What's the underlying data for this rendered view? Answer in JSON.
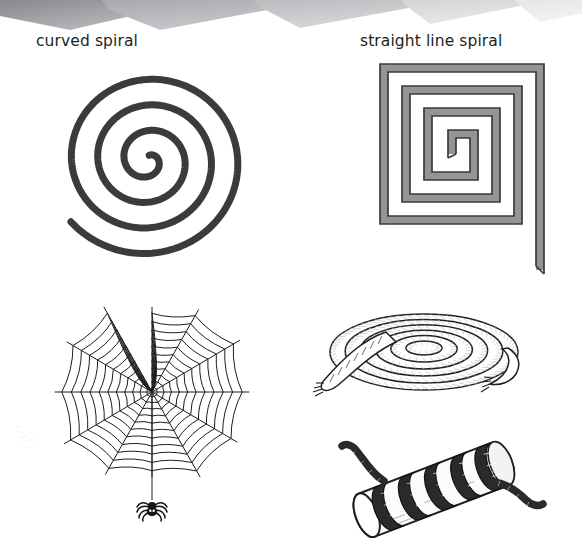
{
  "page": {
    "background_color": "#ffffff",
    "width": 582,
    "height": 549
  },
  "decoration": {
    "top_band": {
      "name": "zigzag-band",
      "description": "row of overlapping gray triangular paper shapes along the top edge",
      "colors": [
        "#8f9093",
        "#a8a9ac",
        "#b9babd",
        "#cbcccf",
        "#dcdddf",
        "#ececed"
      ]
    },
    "smudge": {
      "name": "faint-pencil-smudge",
      "color": "#9a9a9a"
    }
  },
  "labels": {
    "curved_spiral": "curved spiral",
    "straight_line_spiral": "straight line spiral",
    "text_color": "#231f20"
  },
  "figures": [
    {
      "id": "curved-spiral",
      "name": "curved-spiral-drawing",
      "caption": "curved spiral",
      "type": "archimedean-spiral",
      "turns": 3.6,
      "stroke_color": "#3c3b3b",
      "stroke_width": 7,
      "fill": "none",
      "description": "hand drawn round spiral, thick charcoal line, opening at upper right"
    },
    {
      "id": "straight-line-spiral",
      "name": "square-spiral-drawing",
      "caption": "straight line spiral",
      "type": "square-spiral",
      "turns": 4,
      "stroke_color": "#3c3b3b",
      "fill_color": "#949496",
      "stroke_width": 1.6,
      "band_width": 7,
      "description": "rectangular spiral band, gray fill with dark outline, tail continues past the lower right corner"
    },
    {
      "id": "spider-web",
      "name": "spider-web-drawing",
      "type": "orb-web",
      "radials": 12,
      "rings": 11,
      "stroke_color": "#1c1c1c",
      "stroke_width": 1,
      "has_spider": true,
      "spider_color": "#141414",
      "description": "orb spider web with radial spokes and concentric capture spiral, a small spider hangs from a thread below"
    },
    {
      "id": "coiled-rope",
      "name": "coiled-rope-drawing",
      "type": "flat-rope-coil",
      "coils": 6,
      "stroke_color": "#1f1f1f",
      "fill_color": "#ffffff",
      "shade_color": "#b9b9b9",
      "description": "rope coiled flat in an elliptical spiral seen in perspective, twisted fibre texture, frayed ends at left and right"
    },
    {
      "id": "rope-wrapped-log",
      "name": "rope-wrapped-log-drawing",
      "type": "helix-around-cylinder",
      "wraps": 5,
      "cylinder_fill": "#fbfbfb",
      "cylinder_stroke": "#1f1f1f",
      "rope_color": "#2a2a2a",
      "description": "a pale cylinder or log lying diagonally with dark rope wound five times around it, rope ends trailing off at top left and right"
    }
  ]
}
